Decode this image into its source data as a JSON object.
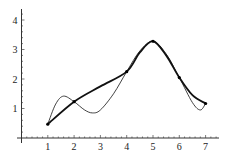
{
  "chart_data": {
    "type": "line",
    "title": "",
    "xlabel": "",
    "ylabel": "",
    "xlim": [
      0,
      7.5
    ],
    "ylim": [
      0,
      4.3
    ],
    "grid": false,
    "legend": null,
    "x_ticks": [
      "1",
      "2",
      "3",
      "4",
      "5",
      "6",
      "7"
    ],
    "y_ticks": [
      "1",
      "2",
      "3",
      "4"
    ],
    "points": {
      "x": [
        1,
        2,
        4,
        5,
        6,
        7
      ],
      "y": [
        0.47,
        1.23,
        2.25,
        3.28,
        2.05,
        1.17
      ]
    },
    "series": [
      {
        "name": "smooth-curve",
        "style": "thick",
        "x": [
          1,
          2,
          3,
          4,
          4.5,
          5,
          5.5,
          6,
          6.5,
          7
        ],
        "y": [
          0.47,
          1.23,
          1.75,
          2.25,
          2.9,
          3.28,
          2.8,
          2.05,
          1.45,
          1.17
        ]
      },
      {
        "name": "polynomial-curve",
        "style": "thin",
        "x": [
          1,
          1.3,
          1.6,
          2,
          2.4,
          2.7,
          3,
          3.5,
          4,
          4.5,
          5,
          5.5,
          6,
          6.5,
          6.8,
          7
        ],
        "y": [
          0.47,
          1.15,
          1.42,
          1.23,
          0.95,
          0.85,
          0.95,
          1.5,
          2.25,
          2.95,
          3.28,
          2.85,
          2.05,
          1.2,
          0.95,
          1.17
        ]
      }
    ]
  }
}
